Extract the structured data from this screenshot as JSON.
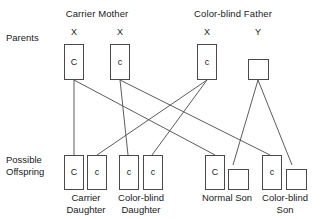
{
  "diagram": {
    "title_hidden": "X-linked color blindness inheritance Punnett-style cross",
    "row_labels": {
      "parents": "Parents",
      "offspring_line1": "Possible",
      "offspring_line2": "Offspring"
    },
    "parents": {
      "mother": {
        "label": "Carrier Mother",
        "chromosomes": [
          {
            "symbol": "X",
            "allele": "C",
            "shape": "tall-box"
          },
          {
            "symbol": "X",
            "allele": "c",
            "shape": "tall-box"
          }
        ]
      },
      "father": {
        "label": "Color-blind Father",
        "chromosomes": [
          {
            "symbol": "X",
            "allele": "c",
            "shape": "tall-box"
          },
          {
            "symbol": "Y",
            "allele": "",
            "shape": "square-box"
          }
        ]
      }
    },
    "offspring": [
      {
        "name_line1": "Carrier",
        "name_line2": "Daughter",
        "alleles": [
          "C",
          "c"
        ],
        "shapes": [
          "tall-box",
          "tall-box"
        ]
      },
      {
        "name_line1": "Color-blind",
        "name_line2": "Daughter",
        "alleles": [
          "c",
          "c"
        ],
        "shapes": [
          "tall-box",
          "tall-box"
        ]
      },
      {
        "name_line1": "Normal Son",
        "name_line2": "",
        "alleles": [
          "C",
          ""
        ],
        "shapes": [
          "tall-box",
          "square-box"
        ]
      },
      {
        "name_line1": "Color-blind",
        "name_line2": "Son",
        "alleles": [
          "c",
          ""
        ],
        "shapes": [
          "tall-box",
          "square-box"
        ]
      }
    ],
    "colors": {
      "stroke": "#4a4a4a",
      "line": "#4a4a4a",
      "text": "#1a1a1a",
      "background": "#ffffff"
    }
  }
}
